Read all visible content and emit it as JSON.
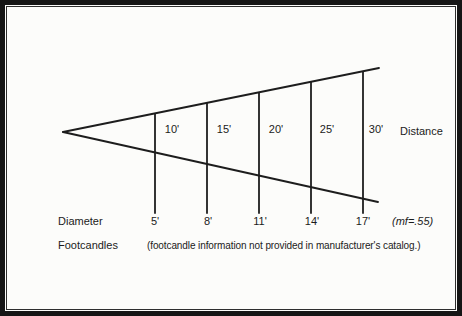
{
  "figure": {
    "distance_axis_label": "Distance",
    "diameter_row_label": "Diameter",
    "footcandles_row_label": "Footcandles",
    "footcandles_note": "(footcandle information not provided in manufacturer's catalog.)",
    "multiplying_factor_note": "(mf=.55)",
    "columns": [
      {
        "distance": "10'",
        "diameter": "5'"
      },
      {
        "distance": "15'",
        "diameter": "8'"
      },
      {
        "distance": "20'",
        "diameter": "11'"
      },
      {
        "distance": "25'",
        "diameter": "14'"
      },
      {
        "distance": "30'",
        "diameter": "17'"
      }
    ],
    "line_color": "#1d1d1d"
  }
}
